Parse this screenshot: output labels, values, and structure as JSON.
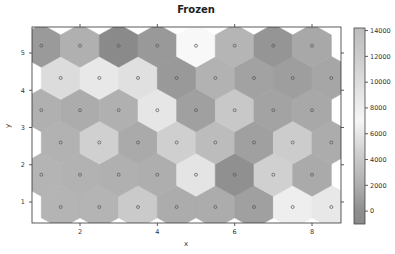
{
  "chart_data": {
    "type": "heatmap",
    "subtype": "hexagonal-som",
    "title": "Frozen",
    "xlabel": "x",
    "ylabel": "y",
    "xlim": [
      0.77,
      8.75
    ],
    "ylim": [
      0.3,
      5.5
    ],
    "xticks": [
      2,
      4,
      6,
      8
    ],
    "yticks": [
      1,
      2,
      3,
      4,
      5
    ],
    "grid": false,
    "colorbar": {
      "position": "right",
      "range": [
        -1000,
        14200
      ],
      "ticks": [
        0,
        2000,
        4000,
        6000,
        8000,
        10000,
        12000,
        14000
      ],
      "tick_labels": [
        "0",
        "2000",
        "4000",
        "6000",
        "8000",
        "10000",
        "12000",
        "14000"
      ],
      "stops": [
        {
          "value": -1000,
          "color": "#8a8a8a"
        },
        {
          "value": 0,
          "color": "#8e8e8e"
        },
        {
          "value": 2000,
          "color": "#aeaeae"
        },
        {
          "value": 4000,
          "color": "#c8c8c8"
        },
        {
          "value": 6000,
          "color": "#e6e6e6"
        },
        {
          "value": 7000,
          "color": "#f6f6f6"
        },
        {
          "value": 8000,
          "color": "#eeeeee"
        },
        {
          "value": 10000,
          "color": "#dddddd"
        },
        {
          "value": 12000,
          "color": "#cccccc"
        },
        {
          "value": 14200,
          "color": "#bcbcbc"
        }
      ]
    },
    "rows": [
      {
        "y": 0.866,
        "x": [
          1.5,
          2.5,
          3.5,
          4.5,
          5.5,
          6.5,
          7.5,
          8.5
        ],
        "values": [
          2670,
          2670,
          4130,
          2130,
          2130,
          1330,
          6530,
          6130
        ],
        "colors": [
          "#b4b4b4",
          "#b4b4b4",
          "#cacaca",
          "#acacac",
          "#acacac",
          "#a0a0a0",
          "#eeeeee",
          "#e8e8e8"
        ]
      },
      {
        "y": 1.732,
        "x": [
          1,
          2,
          3,
          4,
          5,
          6,
          7,
          8
        ],
        "values": [
          2670,
          2530,
          2400,
          2270,
          5870,
          270,
          4530,
          2000
        ],
        "colors": [
          "#b4b4b4",
          "#b2b2b2",
          "#b0b0b0",
          "#aeaeae",
          "#e4e4e4",
          "#909090",
          "#d0d0d0",
          "#aaaaaa"
        ]
      },
      {
        "y": 2.598,
        "x": [
          1.5,
          2.5,
          3.5,
          4.5,
          5.5,
          6.5,
          7.5,
          8.5
        ],
        "values": [
          2530,
          4530,
          2000,
          4470,
          3200,
          1330,
          4270,
          2130
        ],
        "colors": [
          "#b2b2b2",
          "#d0d0d0",
          "#aaaaaa",
          "#cfcfcf",
          "#bcbcbc",
          "#a0a0a0",
          "#cccccc",
          "#acacac"
        ]
      },
      {
        "y": 3.464,
        "x": [
          1,
          2,
          3,
          4,
          5,
          6,
          7,
          8
        ],
        "values": [
          2400,
          2130,
          2400,
          6000,
          1330,
          4000,
          1530,
          1870
        ],
        "colors": [
          "#b0b0b0",
          "#acacac",
          "#b0b0b0",
          "#e6e6e6",
          "#a0a0a0",
          "#c8c8c8",
          "#a3a3a3",
          "#a8a8a8"
        ]
      },
      {
        "y": 4.33,
        "x": [
          1.5,
          2.5,
          3.5,
          4.5,
          5.5,
          6.5,
          7.5,
          8.5
        ],
        "values": [
          5330,
          6130,
          5600,
          870,
          2530,
          1470,
          1200,
          1730
        ],
        "colors": [
          "#dcdcdc",
          "#e8e8e8",
          "#e0e0e0",
          "#999999",
          "#b2b2b2",
          "#a2a2a2",
          "#9e9e9e",
          "#a6a6a6"
        ]
      },
      {
        "y": 5.196,
        "x": [
          1,
          2,
          3,
          4,
          5,
          6,
          7,
          8
        ],
        "values": [
          930,
          2400,
          0,
          870,
          7200,
          2730,
          600,
          1870
        ],
        "colors": [
          "#9a9a9a",
          "#b0b0b0",
          "#8a8a8a",
          "#999999",
          "#f8f8f8",
          "#b5b5b5",
          "#959595",
          "#a8a8a8"
        ]
      }
    ],
    "markers": {
      "shape": "circle",
      "fill": "none",
      "stroke": "#555555"
    }
  }
}
